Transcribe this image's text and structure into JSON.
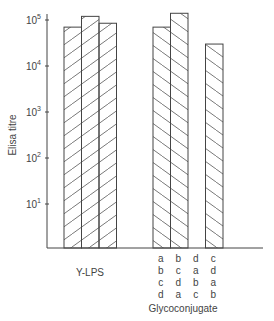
{
  "chart_data": {
    "type": "bar",
    "title": "",
    "ylabel": "Elisa titre",
    "xlabel": "",
    "yscale": "log",
    "ylim": [
      1,
      100000
    ],
    "y_ticks": [
      {
        "base": "10",
        "exp": "1",
        "value": 10
      },
      {
        "base": "10",
        "exp": "2",
        "value": 100
      },
      {
        "base": "10",
        "exp": "3",
        "value": 1000
      },
      {
        "base": "10",
        "exp": "4",
        "value": 10000
      },
      {
        "base": "10",
        "exp": "5",
        "value": 100000
      }
    ],
    "grid": false,
    "legend": null,
    "groups": [
      {
        "name": "Y-LPS",
        "hatch": "forward",
        "bars": [
          {
            "label": "",
            "value": 70000
          },
          {
            "label": "",
            "value": 120000
          },
          {
            "label": "",
            "value": 85000
          }
        ]
      },
      {
        "name": "Glycoconjugate",
        "hatch": "backward",
        "bars": [
          {
            "label": "abcd",
            "label_lines": [
              "a",
              "b",
              "c",
              "d"
            ],
            "value": 70000
          },
          {
            "label": "bcda",
            "label_lines": [
              "b",
              "c",
              "d",
              "a"
            ],
            "value": 140000
          },
          {
            "label": "dabc",
            "label_lines": [
              "d",
              "a",
              "b",
              "c"
            ],
            "value": null
          },
          {
            "label": "cdab",
            "label_lines": [
              "c",
              "d",
              "a",
              "b"
            ],
            "value": 30000
          }
        ]
      }
    ]
  }
}
